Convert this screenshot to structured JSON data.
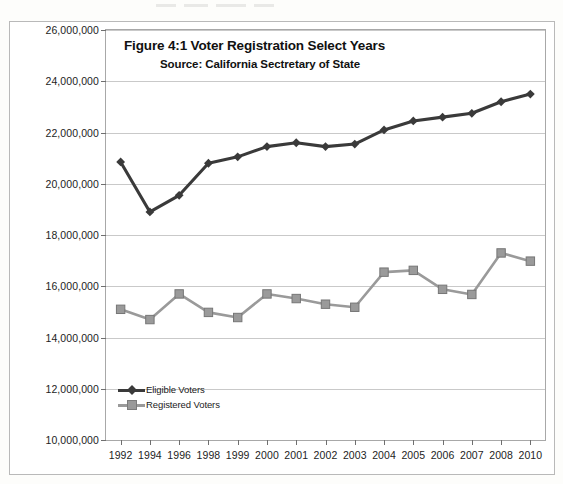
{
  "chart_data": {
    "type": "line",
    "title": "Figure 4:1 Voter Registration Select Years",
    "subtitle": "Source: California Sectretary of State",
    "xlabel": "",
    "ylabel": "",
    "grid": true,
    "legend_position": "bottom-left",
    "ylim": [
      10000000,
      26000000
    ],
    "ytick_step": 2000000,
    "ytick_labels": [
      "26,000,000",
      "24,000,000",
      "22,000,000",
      "20,000,000",
      "18,000,000",
      "16,000,000",
      "14,000,000",
      "12,000,000",
      "10,000,000"
    ],
    "ytick_values": [
      26000000,
      24000000,
      22000000,
      20000000,
      18000000,
      16000000,
      14000000,
      12000000,
      10000000
    ],
    "categories": [
      "1992",
      "1994",
      "1996",
      "1998",
      "1999",
      "2000",
      "2001",
      "2002",
      "2003",
      "2004",
      "2005",
      "2006",
      "2007",
      "2008",
      "2010"
    ],
    "series": [
      {
        "name": "Eligible Voters",
        "color": "#3a3a3a",
        "marker": "diamond",
        "values": [
          20850000,
          18900000,
          19550000,
          20800000,
          21050000,
          21450000,
          21600000,
          21450000,
          21550000,
          22100000,
          22450000,
          22600000,
          22750000,
          23200000,
          23500000
        ]
      },
      {
        "name": "Registered Voters",
        "color": "#9a9a9a",
        "marker": "square",
        "values": [
          15100000,
          14700000,
          15700000,
          14980000,
          14780000,
          15700000,
          15520000,
          15300000,
          15180000,
          16550000,
          16620000,
          15880000,
          15680000,
          17300000,
          16980000
        ]
      }
    ]
  },
  "legend": {
    "items": [
      {
        "label": "Eligible Voters"
      },
      {
        "label": "Registered Voters"
      }
    ]
  }
}
